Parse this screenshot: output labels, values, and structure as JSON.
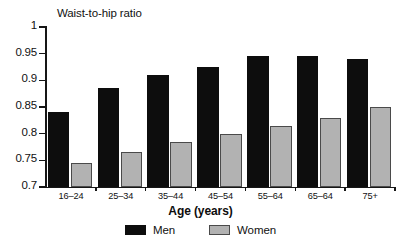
{
  "chart_data": {
    "type": "bar",
    "title": "Waist-to-hip ratio",
    "xlabel": "Age (years)",
    "ylabel": "",
    "ylim": [
      0.7,
      1
    ],
    "yticks": [
      "0.7",
      "0.75",
      "0.8",
      "0.85",
      "0.9",
      "0.95",
      "1"
    ],
    "ytick_values": [
      0.7,
      0.75,
      0.8,
      0.85,
      0.9,
      0.95,
      1
    ],
    "grid": false,
    "legend_position": "bottom",
    "categories": [
      "16–24",
      "25–34",
      "35–44",
      "45–54",
      "55–64",
      "65–64",
      "75+"
    ],
    "series": [
      {
        "name": "Men",
        "color": "#0d0d0d",
        "values": [
          0.84,
          0.885,
          0.91,
          0.925,
          0.945,
          0.945,
          0.94
        ]
      },
      {
        "name": "Women",
        "color": "#b2b2b2",
        "values": [
          0.745,
          0.765,
          0.785,
          0.8,
          0.815,
          0.83,
          0.85
        ]
      }
    ]
  }
}
